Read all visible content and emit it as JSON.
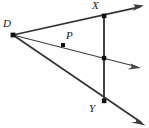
{
  "figure": {
    "type": "geometry-diagram",
    "background_color": "#ffffff",
    "stroke_color": "#333333",
    "point_color": "#111111",
    "canvas": {
      "width": 149,
      "height": 128
    },
    "points": [
      {
        "id": "D",
        "label": "D",
        "x": 13,
        "y": 35,
        "label_x": 3,
        "label_y": 19,
        "dot": true
      },
      {
        "id": "X",
        "label": "X",
        "x": 104,
        "y": 16,
        "label_x": 91,
        "label_y": 1,
        "dot": true
      },
      {
        "id": "P",
        "label": "P",
        "x": 63,
        "y": 45,
        "label_x": 66,
        "label_y": 29,
        "dot": true
      },
      {
        "id": "M",
        "label": "",
        "x": 104,
        "y": 58,
        "label_x": 0,
        "label_y": 0,
        "dot": true
      },
      {
        "id": "Y",
        "label": "Y",
        "x": 104,
        "y": 101,
        "label_x": 89,
        "label_y": 104,
        "dot": true
      }
    ],
    "segments": [
      {
        "id": "transversal-XY",
        "x1": 104,
        "y1": 16,
        "x2": 104,
        "y2": 102
      }
    ],
    "rays": [
      {
        "id": "ray-D-X",
        "x1": 13,
        "y1": 35,
        "x2": 144,
        "y2": 6,
        "arrow": true,
        "width": 1.6
      },
      {
        "id": "ray-D-P",
        "x1": 13,
        "y1": 35,
        "x2": 141,
        "y2": 68,
        "arrow": true,
        "width": 1.1
      },
      {
        "id": "ray-D-Y",
        "x1": 13,
        "y1": 35,
        "x2": 145,
        "y2": 125,
        "arrow": true,
        "width": 1.6
      }
    ],
    "labels": {
      "D": "D",
      "X": "X",
      "P": "P",
      "Y": "Y"
    }
  }
}
